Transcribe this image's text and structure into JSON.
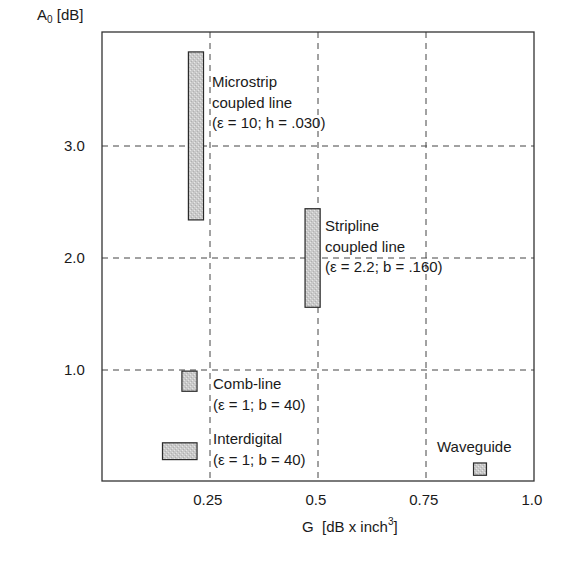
{
  "chart_data": {
    "type": "range-bar",
    "title": "",
    "xlabel": "G [dB x inch^3]",
    "xlabel_prefix": "G  [dB x inch",
    "xlabel_sup": "3",
    "xlabel_suffix": "]",
    "ylabel": "A0 [dB]",
    "ylabel_main": "A",
    "ylabel_sub": "0",
    "ylabel_suffix": " [dB]",
    "xlim": [
      0,
      1.0
    ],
    "ylim": [
      0,
      4.3
    ],
    "grid": "dashed at x ticks and y ticks",
    "x_ticks": [
      {
        "value": 0.25,
        "label": "0.25"
      },
      {
        "value": 0.5,
        "label": "0.5"
      },
      {
        "value": 0.75,
        "label": "0.75"
      },
      {
        "value": 1.0,
        "label": "1.0"
      }
    ],
    "y_ticks": [
      {
        "value": 1.0,
        "label": "1.0"
      },
      {
        "value": 2.0,
        "label": "2.0"
      },
      {
        "value": 3.0,
        "label": "3.0"
      }
    ],
    "series": [
      {
        "name": "Microstrip coupled line",
        "label_lines": [
          "Microstrip",
          "coupled line",
          "(ε = 10; h = .030)"
        ],
        "x_range": [
          0.2,
          0.235
        ],
        "y_range": [
          2.34,
          3.84
        ]
      },
      {
        "name": "Stripline coupled line",
        "label_lines": [
          "Stripline",
          "coupled line",
          "(ε = 2.2; b = .160)"
        ],
        "x_range": [
          0.47,
          0.505
        ],
        "y_range": [
          1.56,
          2.44
        ]
      },
      {
        "name": "Comb-line",
        "label_lines": [
          "Comb-line",
          "(ε = 1; b = 40)"
        ],
        "x_range": [
          0.185,
          0.22
        ],
        "y_range": [
          0.81,
          0.99
        ]
      },
      {
        "name": "Interdigital",
        "label_lines": [
          "Interdigital",
          "(ε = 1; b = 40)"
        ],
        "x_range": [
          0.14,
          0.22
        ],
        "y_range": [
          0.2,
          0.35
        ]
      },
      {
        "name": "Waveguide",
        "label_lines": [
          "Waveguide"
        ],
        "x_range": [
          0.86,
          0.89
        ],
        "y_range": [
          0.06,
          0.17
        ]
      }
    ]
  }
}
